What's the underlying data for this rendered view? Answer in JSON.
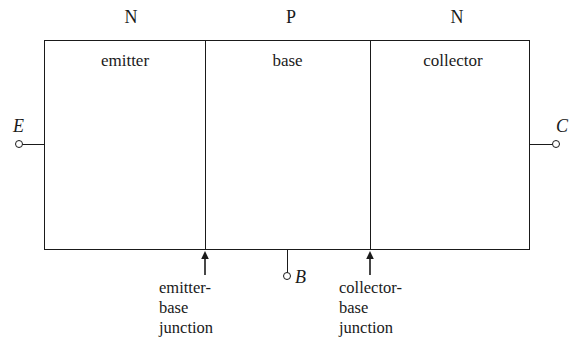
{
  "diagram": {
    "line_color": "#1a1a1a",
    "background_color": "#ffffff",
    "doping_labels": [
      {
        "text": "N",
        "region": "emitter"
      },
      {
        "text": "P",
        "region": "base"
      },
      {
        "text": "N",
        "region": "collector"
      }
    ],
    "regions": [
      {
        "name": "emitter",
        "label": "emitter"
      },
      {
        "name": "base",
        "label": "base"
      },
      {
        "name": "collector",
        "label": "collector"
      }
    ],
    "terminals": [
      {
        "name": "emitter-terminal",
        "label": "E"
      },
      {
        "name": "base-terminal",
        "label": "B"
      },
      {
        "name": "collector-terminal",
        "label": "C"
      }
    ],
    "junctions": [
      {
        "name": "emitter-base-junction",
        "lines": [
          "emitter-",
          "base",
          "junction"
        ]
      },
      {
        "name": "collector-base-junction",
        "lines": [
          "collector-",
          "base",
          "junction"
        ]
      }
    ]
  }
}
